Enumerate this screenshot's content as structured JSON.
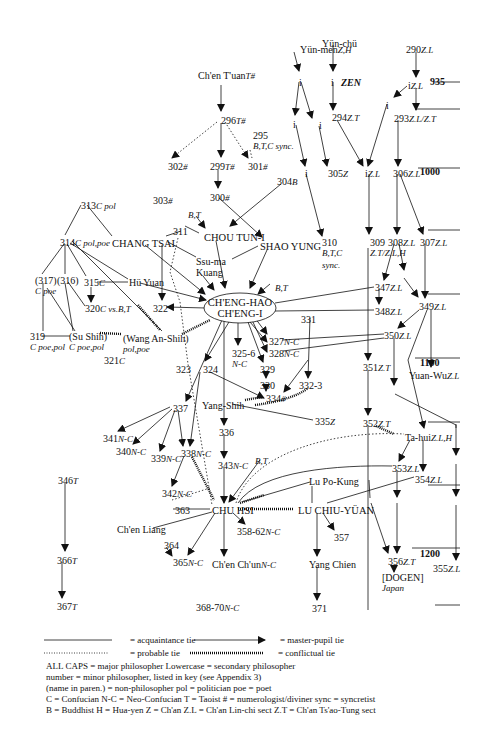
{
  "diagram": {
    "zen_label": "ZEN",
    "timeline": [
      {
        "year": "935",
        "x": 430,
        "y": 76
      },
      {
        "year": "",
        "x": 430,
        "y": 109
      },
      {
        "year": "1000",
        "x": 420,
        "y": 166
      },
      {
        "year": "",
        "x": 430,
        "y": 230
      },
      {
        "year": "",
        "x": 430,
        "y": 293
      },
      {
        "year": "1100",
        "x": 420,
        "y": 357
      },
      {
        "year": "",
        "x": 435,
        "y": 420
      },
      {
        "year": "",
        "x": 435,
        "y": 484
      },
      {
        "year": "1200",
        "x": 420,
        "y": 548
      },
      {
        "year": "",
        "x": 435,
        "y": 605
      }
    ],
    "nodes": [
      {
        "id": "yunmen",
        "text": "Yün-men",
        "tag": "Z,H",
        "x": 300,
        "y": 44
      },
      {
        "id": "yunchu",
        "text": "Yün-chü",
        "tag": "",
        "x": 322,
        "y": 38
      },
      {
        "id": "n290",
        "text": "290",
        "tag": "Z.L",
        "x": 406,
        "y": 44
      },
      {
        "id": "i_a",
        "text": "i",
        "tag": "",
        "x": 299,
        "y": 77
      },
      {
        "id": "i_b",
        "text": "i",
        "tag": "",
        "x": 331,
        "y": 77
      },
      {
        "id": "i_c",
        "text": "i",
        "tag": "Z.L",
        "x": 408,
        "y": 80
      },
      {
        "id": "i_d",
        "text": "i",
        "tag": "",
        "x": 386,
        "y": 100
      },
      {
        "id": "i_e",
        "text": "i",
        "tag": "",
        "x": 293,
        "y": 119
      },
      {
        "id": "i_f",
        "text": "i",
        "tag": "",
        "x": 319,
        "y": 120
      },
      {
        "id": "n294",
        "text": "294",
        "tag": "Z.T",
        "x": 332,
        "y": 112
      },
      {
        "id": "n293",
        "text": "293",
        "tag": "Z.L/Z.T",
        "x": 394,
        "y": 113
      },
      {
        "id": "chentuan",
        "text": "Ch'en T'uan",
        "tag": "T#",
        "x": 198,
        "y": 70
      },
      {
        "id": "n296",
        "text": "296",
        "tag": "T#",
        "x": 221,
        "y": 115
      },
      {
        "id": "n295",
        "text": "295",
        "tag": "",
        "x": 253,
        "y": 130,
        "sub": "B,T,C  sync."
      },
      {
        "id": "n302",
        "text": "302",
        "tag": "#",
        "x": 168,
        "y": 161
      },
      {
        "id": "n299",
        "text": "299",
        "tag": "T#",
        "x": 210,
        "y": 161
      },
      {
        "id": "n301",
        "text": "301",
        "tag": "#",
        "x": 248,
        "y": 161
      },
      {
        "id": "i_g",
        "text": "i",
        "tag": "",
        "x": 305,
        "y": 168
      },
      {
        "id": "n305",
        "text": "305",
        "tag": "Z",
        "x": 328,
        "y": 168
      },
      {
        "id": "i_h",
        "text": "i",
        "tag": "Z.L",
        "x": 365,
        "y": 168
      },
      {
        "id": "n306",
        "text": "306",
        "tag": "Z.L",
        "x": 393,
        "y": 168
      },
      {
        "id": "n303",
        "text": "303",
        "tag": "#",
        "x": 153,
        "y": 195
      },
      {
        "id": "n300",
        "text": "300",
        "tag": "#",
        "x": 210,
        "y": 192
      },
      {
        "id": "n304",
        "text": "304",
        "tag": "B",
        "x": 277,
        "y": 176
      },
      {
        "id": "n313",
        "text": "313",
        "tag": "C pol",
        "x": 81,
        "y": 200
      },
      {
        "id": "bt1",
        "text": "",
        "tag": "B,T",
        "x": 188,
        "y": 209
      },
      {
        "id": "n311",
        "text": "311",
        "tag": "",
        "x": 173,
        "y": 226
      },
      {
        "id": "choutuni",
        "text": "CHOU TUN-I",
        "tag": "",
        "x": 204,
        "y": 232,
        "caps": true
      },
      {
        "id": "n314",
        "text": "314",
        "tag": "C pol,poe",
        "x": 60,
        "y": 237
      },
      {
        "id": "changtsai",
        "text": "CHANG TSAI",
        "tag": "",
        "x": 112,
        "y": 238,
        "caps": true
      },
      {
        "id": "shaoyung",
        "text": "SHAO YUNG",
        "tag": "",
        "x": 260,
        "y": 241,
        "caps": true
      },
      {
        "id": "n310",
        "text": "310",
        "tag": "",
        "x": 322,
        "y": 237,
        "sub": "B,T,C"
      },
      {
        "id": "n310b",
        "text": "",
        "tag": "sync.",
        "x": 322,
        "y": 259
      },
      {
        "id": "n309",
        "text": "309",
        "tag": "",
        "x": 370,
        "y": 237,
        "sub": "Z.T/Z.L,H"
      },
      {
        "id": "n308",
        "text": "308",
        "tag": "Z.L",
        "x": 388,
        "y": 237
      },
      {
        "id": "n307",
        "text": "307",
        "tag": "Z.L",
        "x": 420,
        "y": 237
      },
      {
        "id": "ssuma",
        "text": "Ssu-ma",
        "tag": "",
        "x": 196,
        "y": 256,
        "sub_plain": "Kuang"
      },
      {
        "id": "n317",
        "text": "(317)",
        "tag": "",
        "x": 35,
        "y": 275,
        "sub": "C poe"
      },
      {
        "id": "n316",
        "text": "(316)",
        "tag": "",
        "x": 57,
        "y": 275
      },
      {
        "id": "n315",
        "text": "315",
        "tag": "C",
        "x": 84,
        "y": 277
      },
      {
        "id": "huyuan",
        "text": "Hü Yuan",
        "tag": "",
        "x": 129,
        "y": 277
      },
      {
        "id": "bt2",
        "text": "",
        "tag": "B,T",
        "x": 275,
        "y": 282
      },
      {
        "id": "n347",
        "text": "347",
        "tag": "Z.L",
        "x": 375,
        "y": 282
      },
      {
        "id": "n349",
        "text": "349",
        "tag": "Z.L",
        "x": 419,
        "y": 301
      },
      {
        "id": "n348",
        "text": "348",
        "tag": "Z.L",
        "x": 375,
        "y": 306
      },
      {
        "id": "n320",
        "text": "320",
        "tag": "C vs.B,T",
        "x": 85,
        "y": 303
      },
      {
        "id": "n322",
        "text": "322",
        "tag": "",
        "x": 153,
        "y": 303
      },
      {
        "id": "n331",
        "text": "331",
        "tag": "",
        "x": 301,
        "y": 314
      },
      {
        "id": "n350",
        "text": "350",
        "tag": "Z.L",
        "x": 384,
        "y": 330
      },
      {
        "id": "n319",
        "text": "319",
        "tag": "",
        "x": 30,
        "y": 331,
        "sub": "C poe,pol"
      },
      {
        "id": "sushih",
        "text": "(Su Shih)",
        "tag": "",
        "x": 69,
        "y": 331,
        "sub": "C poe,pol"
      },
      {
        "id": "wanganshih",
        "text": "(Wang An-Shih)",
        "tag": "",
        "x": 123,
        "y": 333,
        "sub": "pol,poe"
      },
      {
        "id": "n321",
        "text": "321",
        "tag": "C",
        "x": 104,
        "y": 355
      },
      {
        "id": "n327",
        "text": "327",
        "tag": "N-C",
        "x": 269,
        "y": 336
      },
      {
        "id": "n328",
        "text": "328",
        "tag": "N-C",
        "x": 269,
        "y": 348
      },
      {
        "id": "n3256",
        "text": "325-6",
        "tag": "",
        "x": 232,
        "y": 348,
        "sub": "N-C"
      },
      {
        "id": "n351",
        "text": "351",
        "tag": "Z.T",
        "x": 363,
        "y": 362
      },
      {
        "id": "yuanwu",
        "text": "Yuan-Wu",
        "tag": "Z.L",
        "x": 409,
        "y": 370
      },
      {
        "id": "n323",
        "text": "323",
        "tag": "",
        "x": 176,
        "y": 364
      },
      {
        "id": "n324",
        "text": "324",
        "tag": "",
        "x": 203,
        "y": 364
      },
      {
        "id": "n329",
        "text": "329",
        "tag": "",
        "x": 260,
        "y": 364
      },
      {
        "id": "n330",
        "text": "330",
        "tag": "",
        "x": 260,
        "y": 380
      },
      {
        "id": "n3323",
        "text": "332-3",
        "tag": "",
        "x": 299,
        "y": 380
      },
      {
        "id": "n334",
        "text": "334",
        "tag": "#",
        "x": 266,
        "y": 393
      },
      {
        "id": "yangshih",
        "text": "Yang-Shih",
        "tag": "",
        "x": 202,
        "y": 400
      },
      {
        "id": "n335",
        "text": "335",
        "tag": "Z",
        "x": 315,
        "y": 416
      },
      {
        "id": "n337",
        "text": "337",
        "tag": "",
        "x": 173,
        "y": 403
      },
      {
        "id": "n352",
        "text": "352",
        "tag": "Z.T",
        "x": 363,
        "y": 418
      },
      {
        "id": "n341",
        "text": "341",
        "tag": "N-C",
        "x": 103,
        "y": 433
      },
      {
        "id": "n336",
        "text": "336",
        "tag": "",
        "x": 219,
        "y": 427
      },
      {
        "id": "tahui",
        "text": "Ta-hui",
        "tag": "Z.L,H",
        "x": 405,
        "y": 432
      },
      {
        "id": "n340",
        "text": "340",
        "tag": "N-C",
        "x": 116,
        "y": 446
      },
      {
        "id": "n339",
        "text": "339",
        "tag": "N-C",
        "x": 151,
        "y": 453
      },
      {
        "id": "n338",
        "text": "338",
        "tag": "N-C",
        "x": 181,
        "y": 448
      },
      {
        "id": "bt3",
        "text": "",
        "tag": "B,T",
        "x": 255,
        "y": 455
      },
      {
        "id": "n343",
        "text": "343",
        "tag": "N-C",
        "x": 218,
        "y": 460
      },
      {
        "id": "n353",
        "text": "353",
        "tag": "Z.L",
        "x": 392,
        "y": 463
      },
      {
        "id": "n346",
        "text": "346",
        "tag": "T",
        "x": 58,
        "y": 475
      },
      {
        "id": "n354",
        "text": "354",
        "tag": "Z.L",
        "x": 415,
        "y": 474
      },
      {
        "id": "lupokung",
        "text": "Lu Po-Kung",
        "tag": "",
        "x": 309,
        "y": 476
      },
      {
        "id": "n342",
        "text": "342",
        "tag": "N-C",
        "x": 162,
        "y": 488
      },
      {
        "id": "n363",
        "text": "363",
        "tag": "",
        "x": 175,
        "y": 505
      },
      {
        "id": "chuhsi",
        "text": "CHU HSI",
        "tag": "",
        "x": 212,
        "y": 505,
        "caps": true
      },
      {
        "id": "luchiuyuan",
        "text": "LU CHIU-YÜAN",
        "tag": "",
        "x": 298,
        "y": 505,
        "caps": true
      },
      {
        "id": "chenliang",
        "text": "Ch'en Liang",
        "tag": "",
        "x": 117,
        "y": 524
      },
      {
        "id": "n35862",
        "text": "358-62",
        "tag": "N-C",
        "x": 237,
        "y": 526
      },
      {
        "id": "n357",
        "text": "357",
        "tag": "",
        "x": 334,
        "y": 532
      },
      {
        "id": "n364",
        "text": "364",
        "tag": "",
        "x": 164,
        "y": 540
      },
      {
        "id": "n366",
        "text": "366",
        "tag": "T",
        "x": 57,
        "y": 555
      },
      {
        "id": "chenchun",
        "text": "Ch'en Ch'un",
        "tag": "N-C",
        "x": 212,
        "y": 559
      },
      {
        "id": "yangchien",
        "text": "Yang Chien",
        "tag": "",
        "x": 309,
        "y": 559
      },
      {
        "id": "n365",
        "text": "365",
        "tag": "N-C",
        "x": 173,
        "y": 557
      },
      {
        "id": "n356",
        "text": "356",
        "tag": "Z.T",
        "x": 388,
        "y": 556
      },
      {
        "id": "dogen",
        "text": "[DOGEN]",
        "tag": "",
        "x": 382,
        "y": 572,
        "sub": "Japan"
      },
      {
        "id": "n355",
        "text": "355",
        "tag": "Z.L",
        "x": 433,
        "y": 563
      },
      {
        "id": "n367",
        "text": "367",
        "tag": "T",
        "x": 57,
        "y": 601
      },
      {
        "id": "n371",
        "text": "371",
        "tag": "",
        "x": 312,
        "y": 603
      },
      {
        "id": "n36870",
        "text": "368-70",
        "tag": "N-C",
        "x": 196,
        "y": 602
      }
    ],
    "main_ellipse": {
      "line1": "CH'ENG-HAO",
      "line2": "CH'ENG-I"
    }
  },
  "legend": {
    "acquaintance": "= acquaintance tie",
    "master_pupil": "= master-pupil tie",
    "probable": "= probable tie",
    "conflictual": "= conflictual tie",
    "rows": [
      "ALL CAPS  = major philosopher    Lowercase  = secondary philosopher",
      "number  = minor philosopher, listed in key (see Appendix 3)",
      "(name in paren.)  = non-philosopher    pol = politician    poe = poet",
      "C = Confucian    N-C = Neo-Confucian    T = Taoist    # = numerologist/diviner        sync = syncretist",
      "B = Buddhist      H = Hua-yen    Z = Ch'an        Z.L = Ch'an Lin-chi sect    Z.T = Ch'an Ts'ao-Tung sect"
    ]
  },
  "colors": {
    "ink": "#111111",
    "background": "#ffffff"
  }
}
